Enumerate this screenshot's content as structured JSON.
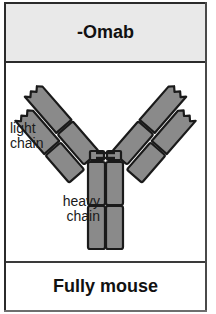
{
  "card": {
    "header": {
      "title": "-Omab"
    },
    "footer": {
      "title": "Fully mouse"
    },
    "labels": {
      "light_chain": "light\nchain",
      "heavy_chain": "heavy\nchain"
    },
    "colors": {
      "domain_fill": "#8a8a8a",
      "domain_stroke": "#1a1a1a",
      "header_bg": "#e9e9e9",
      "frame": "#2b2b2b",
      "text": "#111111"
    },
    "diagram": {
      "type": "antibody-schematic",
      "shape": "Y",
      "description": "monoclonal antibody schematic, all domains shaded grey",
      "arms": 2,
      "domains_per_arm_chain": 2,
      "stem_columns": 2,
      "domains_per_stem_column": 2,
      "hinge_disulfide_bonds": 2,
      "variable_tips_notched": true
    }
  }
}
